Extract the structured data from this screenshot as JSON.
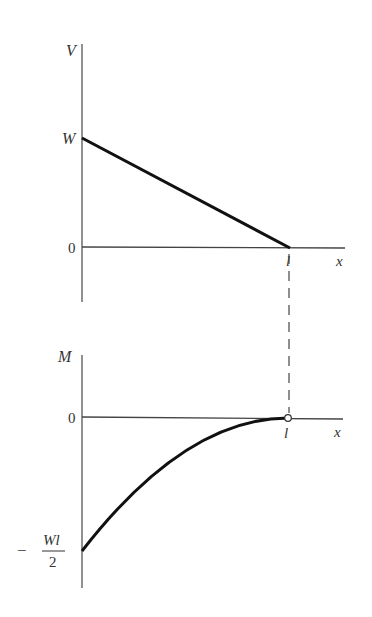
{
  "diagram": {
    "type": "shear-moment-diagram",
    "colors": {
      "axis": "#555555",
      "curve": "#111111",
      "text": "#333333",
      "background": "#ffffff"
    },
    "shear_plot": {
      "y_axis_label": "V",
      "x_axis_label": "x",
      "origin_label": "0",
      "y_intercept_label": "W",
      "x_end_label": "l",
      "shape": "linear from W at x=0 to 0 at x=l"
    },
    "moment_plot": {
      "y_axis_label": "M",
      "x_axis_label": "x",
      "origin_label": "0",
      "x_end_label": "l",
      "y_intercept_label": {
        "sign": "−",
        "numerator": "Wl",
        "denominator": "2"
      },
      "shape": "parabolic from −Wl/2 at x=0 to 0 at x=l with zero slope at x=l"
    },
    "connector": "dashed vertical line linking x=l on both plots"
  }
}
